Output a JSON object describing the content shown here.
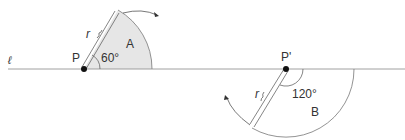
{
  "diagram": {
    "line_label": "ℓ",
    "left": {
      "point_label": "P",
      "radius_label": "r",
      "angle_label": "60°",
      "region_label": "A"
    },
    "right": {
      "point_label": "P'",
      "radius_label": "r",
      "angle_label": "120°",
      "region_label": "B"
    },
    "colors": {
      "sector_fill": "#e6e6e6",
      "stroke": "#555555",
      "point": "#111111"
    }
  }
}
